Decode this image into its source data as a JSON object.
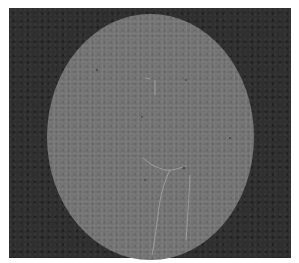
{
  "image": {
    "description": "Grayscale circular field micrograph with faint fibers",
    "colors": {
      "frame": "#2f2f2f",
      "field": "#7c7c7c",
      "fiber": "#b5b5b5",
      "speck": "#3a3a3a"
    }
  }
}
